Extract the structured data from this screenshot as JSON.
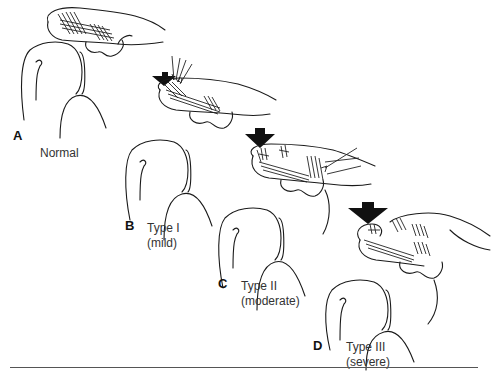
{
  "figure": {
    "type": "medical-illustration",
    "panels": [
      {
        "letter": "A",
        "caption_line1": "Normal",
        "caption_line2": "",
        "arrow_size": "none"
      },
      {
        "letter": "B",
        "caption_line1": "Type I",
        "caption_line2": "(mild)",
        "arrow_size": "small"
      },
      {
        "letter": "C",
        "caption_line1": "Type II",
        "caption_line2": "(moderate)",
        "arrow_size": "medium"
      },
      {
        "letter": "D",
        "caption_line1": "Type III",
        "caption_line2": "(severe)",
        "arrow_size": "large"
      }
    ]
  },
  "colors": {
    "ink": "#1a1a1a",
    "caption": "#333333",
    "rule": "#555555",
    "background": "#ffffff"
  }
}
